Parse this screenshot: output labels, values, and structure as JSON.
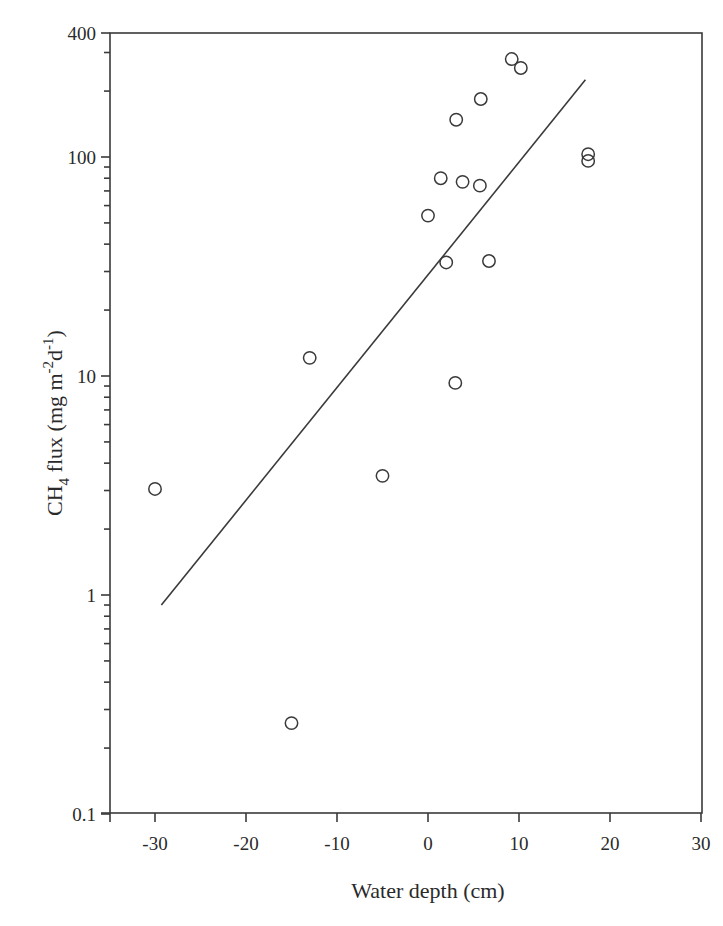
{
  "chart_data": {
    "type": "scatter",
    "title": "",
    "xlabel": "Water depth (cm)",
    "ylabel_parts": {
      "main": "CH",
      "sub": "4",
      "rest": " flux (mg m",
      "sup1": "-2",
      "mid": "d",
      "sup2": "-1",
      "end": ")"
    },
    "ylabel": "CH4 flux (mg m-2 d-1)",
    "xlim": [
      -35,
      30
    ],
    "ylim": [
      0.1,
      400
    ],
    "yscale": "log",
    "grid": false,
    "legend": null,
    "x_ticks": [
      -30,
      -20,
      -10,
      0,
      10,
      20,
      30
    ],
    "x_tick_labels": [
      "-30",
      "-20",
      "-10",
      "0",
      "10",
      "20",
      "30"
    ],
    "y_ticks": [
      0.1,
      1,
      10,
      100,
      400
    ],
    "y_tick_labels": [
      "0.1",
      "1",
      "10",
      "100",
      "400"
    ],
    "series": [
      {
        "name": "observations",
        "marker": "open-circle",
        "points": [
          {
            "x": -30,
            "y": 3.05
          },
          {
            "x": -15,
            "y": 0.26
          },
          {
            "x": -13,
            "y": 12.1
          },
          {
            "x": -5,
            "y": 3.5
          },
          {
            "x": 0,
            "y": 54
          },
          {
            "x": 1.4,
            "y": 80
          },
          {
            "x": 2.0,
            "y": 33
          },
          {
            "x": 3.0,
            "y": 9.3
          },
          {
            "x": 3.1,
            "y": 148
          },
          {
            "x": 3.8,
            "y": 77
          },
          {
            "x": 5.7,
            "y": 74
          },
          {
            "x": 5.8,
            "y": 184
          },
          {
            "x": 6.7,
            "y": 33.5
          },
          {
            "x": 9.2,
            "y": 280
          },
          {
            "x": 10.2,
            "y": 255
          },
          {
            "x": 17.6,
            "y": 103
          },
          {
            "x": 17.6,
            "y": 96
          }
        ]
      },
      {
        "name": "regression fit",
        "type": "line",
        "points": [
          {
            "x": -29.3,
            "y": 0.9
          },
          {
            "x": 17.3,
            "y": 225
          }
        ]
      }
    ]
  }
}
